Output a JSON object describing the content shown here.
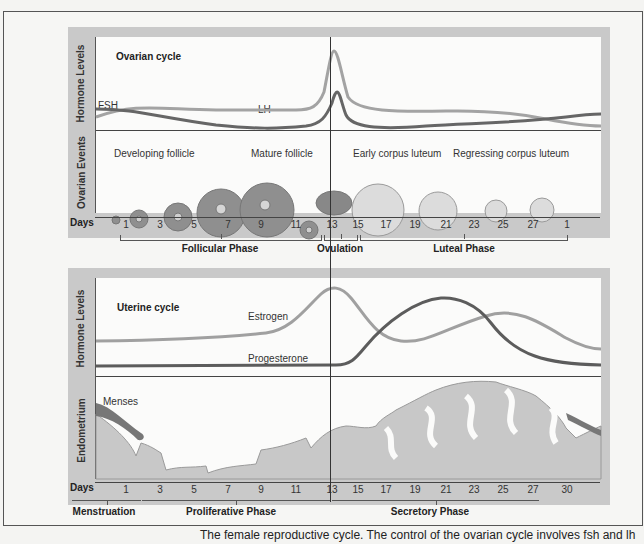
{
  "ovarian_panel": {
    "title": "Ovarian cycle",
    "hormone_axis_label": "Hormone Levels",
    "events_axis_label": "Ovarian Events",
    "hormones": [
      {
        "name": "FSH",
        "color": "#6e6e6e"
      },
      {
        "name": "LH",
        "color": "#9a9a9a"
      }
    ],
    "events": [
      "Developing follicle",
      "Mature follicle",
      "Early corpus luteum",
      "Regressing corpus luteum"
    ],
    "days_label": "Days",
    "day_ticks": [
      "1",
      "3",
      "5",
      "7",
      "9",
      "11",
      "13",
      "15",
      "17",
      "19",
      "21",
      "23",
      "25",
      "27",
      "1"
    ],
    "phases": [
      "Follicular Phase",
      "Ovulation",
      "Luteal Phase"
    ]
  },
  "uterine_panel": {
    "title": "Uterine cycle",
    "hormone_axis_label": "Hormone Levels",
    "endometrium_axis_label": "Endometrium",
    "hormones": [
      {
        "name": "Estrogen",
        "color": "#9a9a9a"
      },
      {
        "name": "Progesterone",
        "color": "#5e5e5e"
      }
    ],
    "menses_label": "Menses",
    "days_label": "Days",
    "day_ticks": [
      "1",
      "3",
      "5",
      "7",
      "9",
      "11",
      "13",
      "15",
      "17",
      "19",
      "21",
      "23",
      "25",
      "27",
      "30"
    ],
    "phases": [
      "Menstruation",
      "Proliferative Phase",
      "Secretory Phase"
    ]
  },
  "caption": "The female reproductive cycle. The control of the ovarian cycle involves fsh and lh"
}
